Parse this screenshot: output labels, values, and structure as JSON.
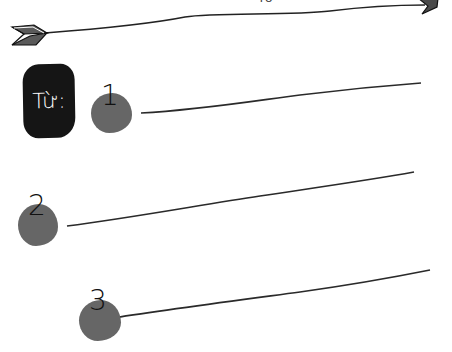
{
  "header": {
    "top_text_fragment": "TỪ"
  },
  "label": {
    "text": "Từ:"
  },
  "items": [
    {
      "number": "1"
    },
    {
      "number": "2"
    },
    {
      "number": "3"
    }
  ],
  "colors": {
    "label_background": "#151515",
    "label_text": "#ffffff",
    "blob": "#666666",
    "line": "#222222",
    "arrow_fletching": "#555555"
  }
}
